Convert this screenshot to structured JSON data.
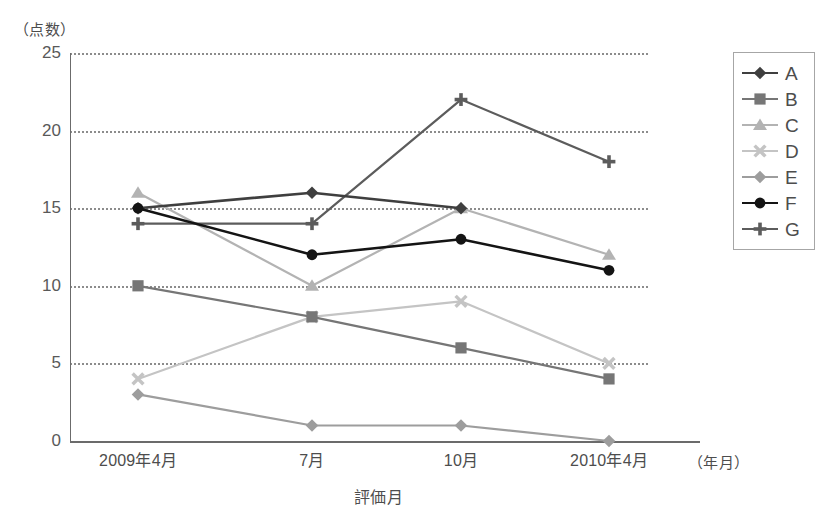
{
  "chart_data": {
    "type": "line",
    "title": "",
    "xlabel": "評価月",
    "ylabel": "（点数）",
    "x_unit_note": "（年月）",
    "categories": [
      "2009年4月",
      "7月",
      "10月",
      "2010年4月"
    ],
    "ylim": [
      0,
      25
    ],
    "yticks": [
      0,
      5,
      10,
      15,
      20,
      25
    ],
    "ytick_labels": [
      "0",
      "5",
      "10",
      "15",
      "20",
      "25"
    ],
    "grid": "horizontal-dotted",
    "legend_position": "right-outside",
    "series": [
      {
        "name": "A",
        "marker": "diamond",
        "color": "#3f3f3f",
        "values": [
          15,
          16,
          15,
          null
        ]
      },
      {
        "name": "B",
        "marker": "square",
        "color": "#767676",
        "values": [
          10,
          8,
          6,
          4
        ]
      },
      {
        "name": "C",
        "marker": "triangle",
        "color": "#b3b3b3",
        "values": [
          16,
          10,
          15,
          12
        ]
      },
      {
        "name": "D",
        "marker": "x",
        "color": "#c4c4c4",
        "values": [
          4,
          8,
          9,
          5
        ]
      },
      {
        "name": "E",
        "marker": "diamond",
        "color": "#9d9d9d",
        "values": [
          3,
          1,
          1,
          0
        ]
      },
      {
        "name": "F",
        "marker": "circle",
        "color": "#141414",
        "values": [
          15,
          12,
          13,
          11
        ]
      },
      {
        "name": "G",
        "marker": "plus",
        "color": "#5c5c5c",
        "values": [
          14,
          14,
          22,
          18
        ]
      }
    ]
  },
  "legend": {
    "entries": [
      "A",
      "B",
      "C",
      "D",
      "E",
      "F",
      "G"
    ]
  }
}
